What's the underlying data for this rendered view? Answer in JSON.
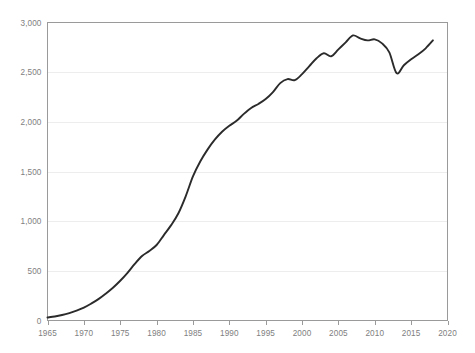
{
  "chart": {
    "title": "",
    "subtitle": "",
    "background_color": "#ffffff",
    "line_color": "#2b2b2b",
    "grid_color": "#ededed",
    "axis_color": "#9a9a9a",
    "tick_label_color": "#808080"
  },
  "chart_data": {
    "type": "line",
    "title": "",
    "xlabel": "",
    "ylabel": "",
    "xlim": [
      1965,
      2020
    ],
    "ylim": [
      0,
      3000
    ],
    "grid": true,
    "legend": null,
    "x_tick_labels": [
      "1965",
      "1970",
      "1975",
      "1980",
      "1985",
      "1990",
      "1995",
      "2000",
      "2005",
      "2010",
      "2015",
      "2020"
    ],
    "x_ticks": [
      1965,
      1970,
      1975,
      1980,
      1985,
      1990,
      1995,
      2000,
      2005,
      2010,
      2015,
      2020
    ],
    "y_tick_labels": [
      "0",
      "500",
      "1,000",
      "1,500",
      "2,000",
      "2,500",
      "3,000"
    ],
    "y_ticks": [
      0,
      500,
      1000,
      1500,
      2000,
      2500,
      3000
    ],
    "series": [
      {
        "name": "series-1",
        "color": "#2b2b2b",
        "x": [
          1965,
          1966,
          1967,
          1968,
          1969,
          1970,
          1971,
          1972,
          1973,
          1974,
          1975,
          1976,
          1977,
          1978,
          1979,
          1980,
          1981,
          1982,
          1983,
          1984,
          1985,
          1986,
          1987,
          1988,
          1989,
          1990,
          1991,
          1992,
          1993,
          1994,
          1995,
          1996,
          1997,
          1998,
          1999,
          2000,
          2001,
          2002,
          2003,
          2004,
          2005,
          2006,
          2007,
          2008,
          2009,
          2010,
          2011,
          2012,
          2013,
          2014,
          2015,
          2016,
          2017,
          2018
        ],
        "values": [
          30,
          40,
          55,
          75,
          100,
          130,
          170,
          215,
          270,
          330,
          400,
          480,
          570,
          650,
          700,
          760,
          860,
          960,
          1080,
          1250,
          1450,
          1600,
          1720,
          1820,
          1900,
          1960,
          2010,
          2080,
          2140,
          2180,
          2230,
          2300,
          2390,
          2430,
          2420,
          2480,
          2560,
          2640,
          2690,
          2660,
          2730,
          2800,
          2870,
          2840,
          2820,
          2830,
          2790,
          2700,
          2490,
          2570,
          2630,
          2680,
          2740,
          2820
        ]
      }
    ]
  }
}
